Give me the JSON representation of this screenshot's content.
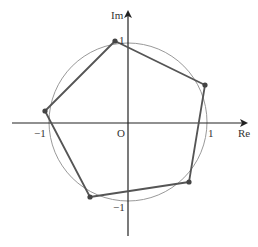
{
  "diagram": {
    "axes": {
      "x_label": "Re",
      "y_label": "Im",
      "origin_label": "O",
      "ticks": {
        "x_pos": "1",
        "x_neg": "−1",
        "y_pos": "1",
        "y_neg": "−1"
      }
    },
    "geometry": {
      "origin_px": [
        128,
        123
      ],
      "unit_px": 80,
      "circle_radius": 1,
      "vertices": [
        {
          "label": "v1",
          "re": -0.16,
          "im": 1.02
        },
        {
          "label": "v2",
          "re": 0.96,
          "im": 0.47
        },
        {
          "label": "v3",
          "re": 0.76,
          "im": -0.74
        },
        {
          "label": "v4",
          "re": -0.48,
          "im": -0.93
        },
        {
          "label": "v5",
          "re": -1.04,
          "im": 0.15
        }
      ]
    },
    "colors": {
      "axis": "#222222",
      "circle": "#999999",
      "polygon": "#555555",
      "vertex": "#444444"
    }
  }
}
